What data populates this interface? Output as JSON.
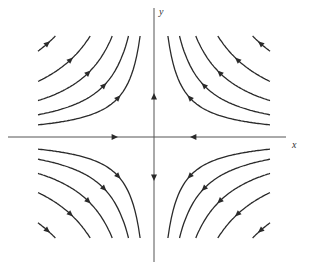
{
  "figure": {
    "type": "phase-portrait",
    "x_axis_label": "x",
    "y_axis_label": "y",
    "caption": "",
    "origin": [
      154,
      137
    ],
    "line_color": "#2a2a2a",
    "axis_color": "#555555",
    "hyperbola_constants": [
      0.12,
      0.22,
      0.36,
      0.55,
      0.85
    ],
    "half_width": 116,
    "half_height": 101
  }
}
